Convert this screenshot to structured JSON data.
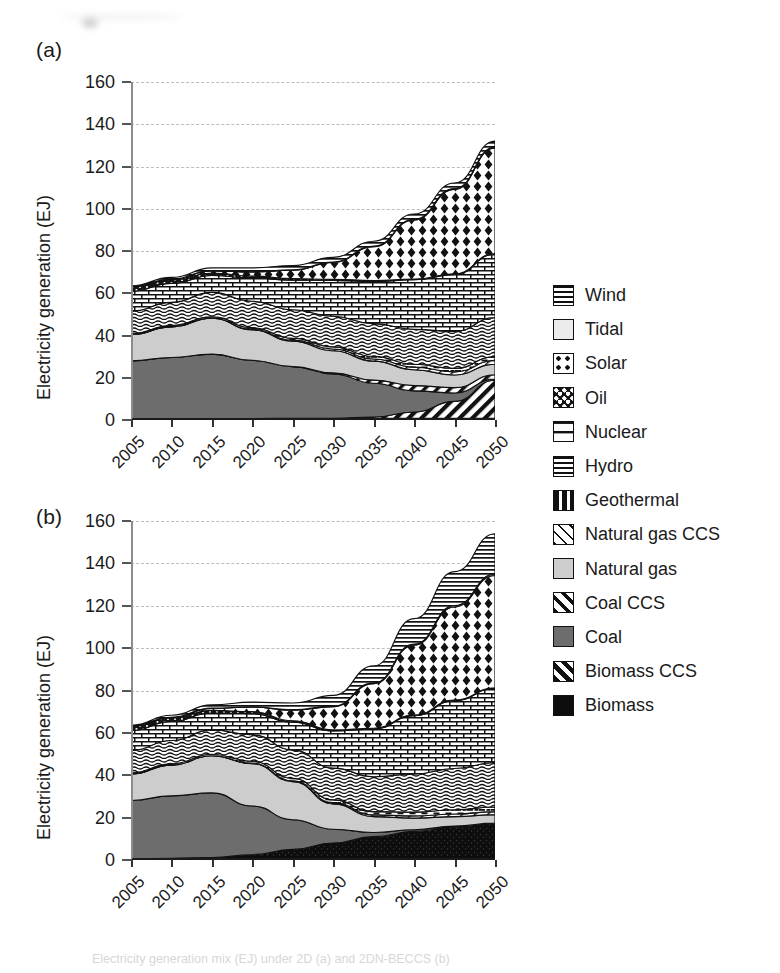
{
  "figure": {
    "panel_a_label": "(a)",
    "panel_b_label": "(b)",
    "caption": "Electricity generation mix (EJ) under 2D (a) and 2DN-BECCS (b)"
  },
  "legend": {
    "items": [
      {
        "label": "Wind",
        "pattern": "horizontal-lines"
      },
      {
        "label": "Tidal",
        "pattern": "light-solid"
      },
      {
        "label": "Solar",
        "pattern": "checkerboard-diamond"
      },
      {
        "label": "Oil",
        "pattern": "dark-dots"
      },
      {
        "label": "Nuclear",
        "pattern": "brick"
      },
      {
        "label": "Hydro",
        "pattern": "wavy-lines"
      },
      {
        "label": "Geothermal",
        "pattern": "dashed-lines"
      },
      {
        "label": "Natural gas CCS",
        "pattern": "diagonal-thin"
      },
      {
        "label": "Natural gas",
        "pattern": "light-gray-solid"
      },
      {
        "label": "Coal CCS",
        "pattern": "diagonal-thick"
      },
      {
        "label": "Coal",
        "pattern": "dark-gray-solid"
      },
      {
        "label": "Biomass CCS",
        "pattern": "diagonal-bold"
      },
      {
        "label": "Biomass",
        "pattern": "black-solid"
      }
    ]
  },
  "chart_data": [
    {
      "type": "area",
      "panel": "(a)",
      "title": "",
      "xlabel": "",
      "ylabel": "Electricity generation (EJ)",
      "x": [
        2005,
        2010,
        2015,
        2020,
        2025,
        2030,
        2035,
        2040,
        2045,
        2050
      ],
      "xtick_labels": [
        "2005",
        "2010",
        "2015",
        "2020",
        "2025",
        "2030",
        "2035",
        "2040",
        "2045",
        "2050"
      ],
      "ytick_labels": [
        "0",
        "20",
        "40",
        "60",
        "80",
        "100",
        "120",
        "140",
        "160"
      ],
      "ylim": [
        0,
        160
      ],
      "ytick_step": 20,
      "grid": true,
      "legend_position": "right",
      "stack_order_bottom_to_top": [
        "Biomass",
        "Biomass CCS",
        "Coal",
        "Coal CCS",
        "Natural gas",
        "Natural gas CCS",
        "Geothermal",
        "Hydro",
        "Nuclear",
        "Oil",
        "Solar",
        "Tidal",
        "Wind"
      ],
      "series": [
        {
          "name": "Biomass",
          "values": [
            0.6,
            0.6,
            0.7,
            0.7,
            0.8,
            0.8,
            0.8,
            0.8,
            0.8,
            0.8
          ]
        },
        {
          "name": "Biomass CCS",
          "values": [
            0.0,
            0.0,
            0.0,
            0.0,
            0.0,
            0.0,
            0.6,
            3.0,
            8.0,
            18.0
          ]
        },
        {
          "name": "Coal",
          "values": [
            27.4,
            29.0,
            30.5,
            27.5,
            24.5,
            21.0,
            16.0,
            10.0,
            4.0,
            0.6
          ]
        },
        {
          "name": "Coal CCS",
          "values": [
            0.0,
            0.0,
            0.0,
            0.0,
            0.0,
            0.5,
            1.5,
            2.5,
            2.5,
            2.0
          ]
        },
        {
          "name": "Natural gas",
          "values": [
            12.5,
            14.5,
            17.0,
            14.5,
            12.0,
            10.5,
            9.0,
            7.5,
            6.0,
            5.0
          ]
        },
        {
          "name": "Natural gas CCS",
          "values": [
            0.0,
            0.0,
            0.0,
            0.2,
            0.5,
            0.8,
            1.0,
            1.2,
            1.5,
            1.8
          ]
        },
        {
          "name": "Geothermal",
          "values": [
            0.5,
            0.6,
            0.7,
            0.8,
            0.9,
            1.0,
            1.2,
            1.4,
            1.6,
            1.8
          ]
        },
        {
          "name": "Hydro",
          "values": [
            10.5,
            11.0,
            11.5,
            12.5,
            13.5,
            14.5,
            15.5,
            16.5,
            17.5,
            18.5
          ]
        },
        {
          "name": "Nuclear",
          "values": [
            9.5,
            9.0,
            8.0,
            11.0,
            14.0,
            17.0,
            20.0,
            23.5,
            27.0,
            30.0
          ]
        },
        {
          "name": "Oil",
          "values": [
            2.0,
            1.6,
            1.2,
            0.9,
            0.7,
            0.5,
            0.4,
            0.3,
            0.3,
            0.3
          ]
        },
        {
          "name": "Solar",
          "values": [
            0.1,
            0.4,
            1.0,
            2.0,
            4.0,
            8.0,
            16.0,
            28.0,
            40.0,
            50.0
          ]
        },
        {
          "name": "Tidal",
          "values": [
            0.0,
            0.0,
            0.1,
            0.1,
            0.2,
            0.2,
            0.3,
            0.3,
            0.4,
            0.4
          ]
        },
        {
          "name": "Wind",
          "values": [
            0.4,
            0.8,
            1.3,
            1.8,
            2.0,
            2.2,
            2.3,
            2.5,
            2.6,
            2.8
          ]
        }
      ],
      "totals": [
        63.5,
        67.5,
        72.0,
        72.0,
        73.1,
        77.0,
        84.6,
        97.5,
        112.2,
        132.0
      ]
    },
    {
      "type": "area",
      "panel": "(b)",
      "title": "",
      "xlabel": "",
      "ylabel": "Electricity generation (EJ)",
      "x": [
        2005,
        2010,
        2015,
        2020,
        2025,
        2030,
        2035,
        2040,
        2045,
        2050
      ],
      "xtick_labels": [
        "2005",
        "2010",
        "2015",
        "2020",
        "2025",
        "2030",
        "2035",
        "2040",
        "2045",
        "2050"
      ],
      "ytick_labels": [
        "0",
        "20",
        "40",
        "60",
        "80",
        "100",
        "120",
        "140",
        "160"
      ],
      "ylim": [
        0,
        160
      ],
      "ytick_step": 20,
      "grid": true,
      "legend_position": "right",
      "stack_order_bottom_to_top": [
        "Biomass",
        "Biomass CCS",
        "Coal",
        "Coal CCS",
        "Natural gas",
        "Natural gas CCS",
        "Geothermal",
        "Hydro",
        "Nuclear",
        "Oil",
        "Solar",
        "Tidal",
        "Wind"
      ],
      "series": [
        {
          "name": "Biomass",
          "values": [
            0.6,
            0.8,
            1.2,
            2.5,
            5.0,
            8.0,
            11.0,
            13.5,
            15.5,
            17.0
          ]
        },
        {
          "name": "Biomass CCS",
          "values": [
            0.0,
            0.0,
            0.0,
            0.0,
            0.0,
            0.0,
            0.0,
            0.0,
            0.0,
            0.0
          ]
        },
        {
          "name": "Coal",
          "values": [
            27.5,
            29.5,
            30.5,
            23.0,
            14.0,
            6.5,
            2.0,
            0.8,
            0.5,
            0.4
          ]
        },
        {
          "name": "Coal CCS",
          "values": [
            0.0,
            0.0,
            0.0,
            0.0,
            0.0,
            0.0,
            0.0,
            0.0,
            0.0,
            0.0
          ]
        },
        {
          "name": "Natural gas",
          "values": [
            12.5,
            14.5,
            17.5,
            20.0,
            18.0,
            12.0,
            7.5,
            5.5,
            4.5,
            4.0
          ]
        },
        {
          "name": "Natural gas CCS",
          "values": [
            0.0,
            0.0,
            0.0,
            0.2,
            0.4,
            0.6,
            0.8,
            1.0,
            1.2,
            1.4
          ]
        },
        {
          "name": "Geothermal",
          "values": [
            0.5,
            0.6,
            0.7,
            0.9,
            1.1,
            1.3,
            1.5,
            1.8,
            2.0,
            2.2
          ]
        },
        {
          "name": "Hydro",
          "values": [
            10.5,
            11.0,
            11.5,
            12.5,
            13.5,
            15.0,
            16.5,
            18.0,
            19.5,
            21.0
          ]
        },
        {
          "name": "Nuclear",
          "values": [
            9.5,
            9.0,
            8.0,
            10.0,
            13.0,
            17.5,
            22.5,
            27.5,
            32.0,
            35.0
          ]
        },
        {
          "name": "Oil",
          "values": [
            2.0,
            1.6,
            1.2,
            0.9,
            0.7,
            0.5,
            0.4,
            0.3,
            0.3,
            0.3
          ]
        },
        {
          "name": "Solar",
          "values": [
            0.1,
            0.4,
            1.0,
            2.2,
            5.0,
            11.0,
            21.0,
            33.0,
            44.0,
            53.0
          ]
        },
        {
          "name": "Tidal",
          "values": [
            0.0,
            0.0,
            0.1,
            0.1,
            0.2,
            0.3,
            0.4,
            0.5,
            0.6,
            0.7
          ]
        },
        {
          "name": "Wind",
          "values": [
            0.4,
            0.9,
            1.5,
            2.2,
            3.2,
            5.0,
            8.0,
            12.0,
            16.0,
            19.0
          ]
        }
      ],
      "totals": [
        63.6,
        68.3,
        73.2,
        74.5,
        74.1,
        77.7,
        91.6,
        113.9,
        136.1,
        154.0
      ]
    }
  ],
  "colors": {
    "biomass": "#0d0d0d",
    "coal": "#6b6b6b",
    "natural_gas": "#cfcfcf",
    "tidal": "#e8e8e8",
    "oil": "#1a1a1a",
    "axis": "#1a1a1a",
    "grid": "#bdbdbd",
    "background": "#ffffff"
  }
}
